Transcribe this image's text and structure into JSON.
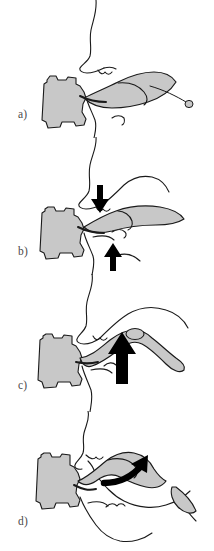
{
  "figure": {
    "background_color": "#ffffff",
    "line_color": "#1a1a1a",
    "fill_gray": "#c8c8c8",
    "arrow_color": "#000000",
    "panel_count": 4
  },
  "panels": [
    {
      "id": "a",
      "label": "a)",
      "caption_text": "a)",
      "arrows": [],
      "description": "Flap elevated and rotated, thin distal tail with terminal bulb extending to the right."
    },
    {
      "id": "b",
      "label": "b)",
      "caption_text": "b)",
      "arrows": [
        {
          "name": "down-arrow",
          "direction": "down"
        },
        {
          "name": "up-arrow",
          "direction": "up"
        }
      ],
      "description": "Two straight arrows indicate opposing closure forces above and below the pedicle."
    },
    {
      "id": "c",
      "label": "c)",
      "caption_text": "c)",
      "arrows": [
        {
          "name": "up-arrow",
          "direction": "up"
        }
      ],
      "description": "Single large upward arrow beneath the narrowed flap pedicle."
    },
    {
      "id": "d",
      "label": "d)",
      "caption_text": "d)",
      "arrows": [
        {
          "name": "curved-arrow",
          "direction": "up-right"
        }
      ],
      "description": "Curved arrow showing rotation of the flap up and to the right into the defect."
    }
  ]
}
